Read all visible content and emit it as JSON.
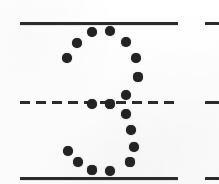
{
  "figure": {
    "caption": "",
    "background_color": "#fdfdfd",
    "ink_color": "#232323",
    "rule_color": "#2b2b2b",
    "canvas": {
      "width": 219,
      "height": 184
    },
    "glyph": {
      "label": "3",
      "description": "dotted outline of the numeral three",
      "dot_count": 21,
      "dot_diameter": 9
    },
    "rules": [
      {
        "name": "top-solid-rule",
        "style": "solid",
        "x": 20,
        "y": 22,
        "width": 158,
        "thickness": 3,
        "role": "ascender-line"
      },
      {
        "name": "middle-dashed-rule",
        "style": "dashed",
        "x": 20,
        "y": 101,
        "width": 158,
        "thickness": 3,
        "role": "midline",
        "dash_length": 10,
        "dash_gap": 6
      },
      {
        "name": "bottom-solid-rule",
        "style": "solid",
        "x": 20,
        "y": 177,
        "width": 158,
        "thickness": 3,
        "role": "baseline"
      }
    ],
    "rule_stubs": [
      {
        "name": "top-rule-stub",
        "x": 205,
        "y": 22,
        "width": 14,
        "thickness": 3
      },
      {
        "name": "middle-rule-stub",
        "x": 205,
        "y": 101,
        "width": 14,
        "thickness": 3
      },
      {
        "name": "bottom-rule-stub",
        "x": 205,
        "y": 177,
        "width": 14,
        "thickness": 3
      }
    ],
    "dots": [
      {
        "id": 1,
        "x": 92,
        "y": 32,
        "r": 5.0
      },
      {
        "id": 2,
        "x": 110,
        "y": 31,
        "r": 5.0
      },
      {
        "id": 3,
        "x": 77,
        "y": 43,
        "r": 4.8
      },
      {
        "id": 4,
        "x": 126,
        "y": 42,
        "r": 5.0
      },
      {
        "id": 5,
        "x": 67,
        "y": 58,
        "r": 4.8
      },
      {
        "id": 6,
        "x": 136,
        "y": 58,
        "r": 4.8
      },
      {
        "id": 7,
        "x": 138,
        "y": 77,
        "r": 4.6
      },
      {
        "id": 8,
        "x": 126,
        "y": 95,
        "r": 5.0
      },
      {
        "id": 9,
        "x": 92,
        "y": 104,
        "r": 4.8
      },
      {
        "id": 10,
        "x": 110,
        "y": 104,
        "r": 4.6
      },
      {
        "id": 11,
        "x": 126,
        "y": 114,
        "r": 4.8
      },
      {
        "id": 12,
        "x": 131,
        "y": 130,
        "r": 4.8
      },
      {
        "id": 13,
        "x": 134,
        "y": 147,
        "r": 4.8
      },
      {
        "id": 14,
        "x": 68,
        "y": 151,
        "r": 4.8
      },
      {
        "id": 15,
        "x": 130,
        "y": 162,
        "r": 4.6
      },
      {
        "id": 16,
        "x": 78,
        "y": 162,
        "r": 4.8
      },
      {
        "id": 17,
        "x": 92,
        "y": 170,
        "r": 4.6
      },
      {
        "id": 18,
        "x": 110,
        "y": 171,
        "r": 4.8
      }
    ]
  }
}
